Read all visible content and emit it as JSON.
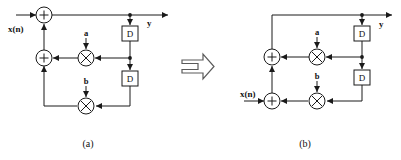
{
  "figure": {
    "width": 401,
    "height": 160,
    "background": "#ffffff",
    "line_color": "#1a1a1a"
  },
  "transform_arrow": {
    "name": "implies-arrow",
    "symbol": "⇒"
  },
  "diagrams": [
    {
      "id": "a",
      "caption": "(a)",
      "input_label": "x(n)",
      "output_label": "y",
      "coefficients": [
        "a",
        "b"
      ],
      "delay_label": "D",
      "adders": [
        {
          "name": "adder-top",
          "symbol": "+",
          "cx": 44,
          "cy": 15
        },
        {
          "name": "adder-middle",
          "symbol": "+",
          "cx": 44,
          "cy": 58
        }
      ],
      "multipliers": [
        {
          "name": "multiplier-a",
          "symbol": "×",
          "cx": 86,
          "cy": 58,
          "coef": "a"
        },
        {
          "name": "multiplier-b",
          "symbol": "×",
          "cx": 86,
          "cy": 106,
          "coef": "b"
        }
      ],
      "delays": [
        {
          "name": "delay-1",
          "label": "D",
          "x": 122,
          "y": 26
        },
        {
          "name": "delay-2",
          "label": "D",
          "x": 122,
          "y": 71
        }
      ]
    },
    {
      "id": "b",
      "caption": "(b)",
      "input_label": "x(n)",
      "output_label": "y",
      "coefficients": [
        "a",
        "b"
      ],
      "delay_label": "D",
      "adders": [
        {
          "name": "adder-middle",
          "symbol": "+",
          "cx": 272,
          "cy": 57
        },
        {
          "name": "adder-bottom",
          "symbol": "+",
          "cx": 272,
          "cy": 101
        }
      ],
      "multipliers": [
        {
          "name": "multiplier-a",
          "symbol": "×",
          "cx": 317,
          "cy": 57,
          "coef": "a"
        },
        {
          "name": "multiplier-b",
          "symbol": "×",
          "cx": 317,
          "cy": 101,
          "coef": "b"
        }
      ],
      "delays": [
        {
          "name": "delay-1",
          "label": "D",
          "x": 354,
          "y": 26
        },
        {
          "name": "delay-2",
          "label": "D",
          "x": 354,
          "y": 70
        }
      ]
    }
  ]
}
